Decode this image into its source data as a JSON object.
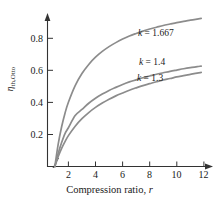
{
  "chart_data": {
    "type": "line",
    "title": "",
    "xlabel": "Compression ratio, r",
    "ylabel_symbol": "η",
    "ylabel_subscript": "th,Otto",
    "ylabel": "ηth,Otto",
    "xlim": [
      0.5,
      12.8
    ],
    "ylim": [
      0,
      0.9
    ],
    "xticks": [
      2,
      4,
      6,
      8,
      10,
      12
    ],
    "xtick_labels": [
      "2",
      "4",
      "6",
      "8",
      "10",
      "12"
    ],
    "yticks": [
      0.2,
      0.4,
      0.6,
      0.8
    ],
    "ytick_labels": [
      "0.2",
      "0.4",
      "0.6",
      "0.8"
    ],
    "grid": false,
    "legend_position": "inline-right-of-curves",
    "axis_break": true,
    "x_values": [
      1,
      1.25,
      1.5,
      1.75,
      2,
      2.5,
      3,
      3.5,
      4,
      4.5,
      5,
      5.5,
      6,
      6.5,
      7,
      7.5,
      8,
      8.5,
      9,
      9.5,
      10,
      10.5,
      11,
      11.5,
      11.8
    ],
    "series": [
      {
        "name": "k = 1.667",
        "k": 1.667,
        "color": "#8c8c8c",
        "formula": "1 - 1/r^(k-1)",
        "values": [
          0,
          0.141,
          0.248,
          0.333,
          0.401,
          0.505,
          0.58,
          0.637,
          0.682,
          0.718,
          0.748,
          0.773,
          0.795,
          0.814,
          0.83,
          0.845,
          0.858,
          0.869,
          0.88,
          0.889,
          0.898,
          0.906,
          0.913,
          0.92,
          0.924
        ],
        "label_x": 9.0,
        "label_y": 0.83
      },
      {
        "name": "k = 1.4",
        "k": 1.4,
        "color": "#8c8c8c",
        "formula": "1 - 1/r^(k-1)",
        "values": [
          0,
          0.083,
          0.15,
          0.206,
          0.242,
          0.318,
          0.356,
          0.395,
          0.426,
          0.452,
          0.475,
          0.494,
          0.512,
          0.528,
          0.541,
          0.554,
          0.565,
          0.576,
          0.585,
          0.594,
          0.602,
          0.61,
          0.617,
          0.623,
          0.627
        ],
        "label_x": 8.6,
        "label_y": 0.64
      },
      {
        "name": "k = 1.3",
        "k": 1.3,
        "color": "#8c8c8c",
        "formula": "1 - 1/r^(k-1)",
        "values": [
          0,
          0.063,
          0.114,
          0.156,
          0.193,
          0.252,
          0.299,
          0.337,
          0.369,
          0.396,
          0.42,
          0.441,
          0.459,
          0.476,
          0.491,
          0.505,
          0.517,
          0.529,
          0.54,
          0.549,
          0.559,
          0.567,
          0.575,
          0.583,
          0.587
        ],
        "label_x": 8.4,
        "label_y": 0.545
      }
    ],
    "annotations": [
      {
        "text": "k = 1.667",
        "symbol": "k",
        "value": "1.667"
      },
      {
        "text": "k = 1.4",
        "symbol": "k",
        "value": "1.4"
      },
      {
        "text": "k = 1.3",
        "symbol": "k",
        "value": "1.3"
      }
    ],
    "colors": {
      "curve": "#8c8c8c",
      "axis": "#333333",
      "text": "#1a1a1a",
      "background": "#ffffff"
    }
  }
}
